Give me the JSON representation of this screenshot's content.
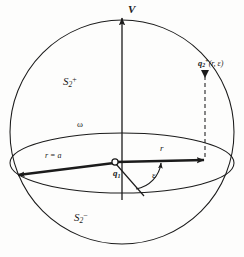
{
  "figure": {
    "type": "geometry-diagram",
    "background_color": "#fdfdfc",
    "stroke_color": "#1b1b1b",
    "labels": {
      "axis_vertical": "V",
      "upper_hemisphere": {
        "base": "S",
        "sub": "2",
        "sup": "+"
      },
      "lower_hemisphere": {
        "base": "S",
        "sub": "2",
        "sup": "−"
      },
      "equator": "ω",
      "point_q2": {
        "base": "q",
        "sub": "2",
        "sup": "+",
        "args": "(r, ε)"
      },
      "center": {
        "base": "q",
        "sub": "1"
      },
      "radius_left": "r = a",
      "radius_right": "r",
      "angle": "ε"
    },
    "geometry": {
      "sphere_center": [
        122,
        132
      ],
      "sphere_radius_x": 112,
      "sphere_radius_y": 112,
      "equator_rx": 112,
      "equator_ry": 30,
      "origin": [
        115,
        163
      ],
      "arrow_right_tip": [
        205,
        160
      ],
      "arrow_left_tip": [
        14,
        176
      ],
      "point_q2_xy": [
        205,
        73
      ],
      "axis_top": [
        122,
        14
      ],
      "angle_arc_label_xy": [
        152,
        171
      ]
    }
  }
}
